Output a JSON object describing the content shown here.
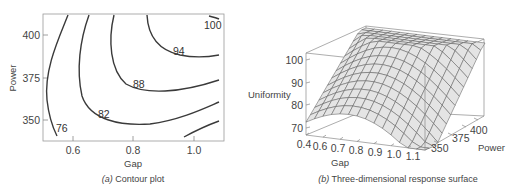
{
  "chart_data": [
    {
      "type": "contour",
      "title": "Contour plot",
      "caption_prefix": "(a)",
      "caption_text": " Contour plot",
      "xlabel": "Gap",
      "ylabel": "Power",
      "xlim": [
        0.5,
        1.08
      ],
      "ylim": [
        336,
        422
      ],
      "xticks": [
        "0.6",
        "0.8",
        "1.0"
      ],
      "yticks": [
        "350",
        "375",
        "400"
      ],
      "contour_levels": [
        "76",
        "82",
        "88",
        "94",
        "100"
      ],
      "grid": false
    },
    {
      "type": "surface",
      "title": "Three-dimensional response surface",
      "caption_prefix": "(b)",
      "caption_text": " Three-dimensional response surface",
      "xlabel": "Gap",
      "ylabel": "Power",
      "zlabel": "Uniformity",
      "xticks": [
        "0.4",
        "0.6",
        "0.7",
        "0.8",
        "0.9",
        "1.0",
        "1.1"
      ],
      "yticks": [
        "350",
        "375",
        "400"
      ],
      "zticks": [
        "70",
        "80",
        "90",
        "100"
      ],
      "zlim": [
        68,
        102
      ],
      "grid": false
    }
  ]
}
